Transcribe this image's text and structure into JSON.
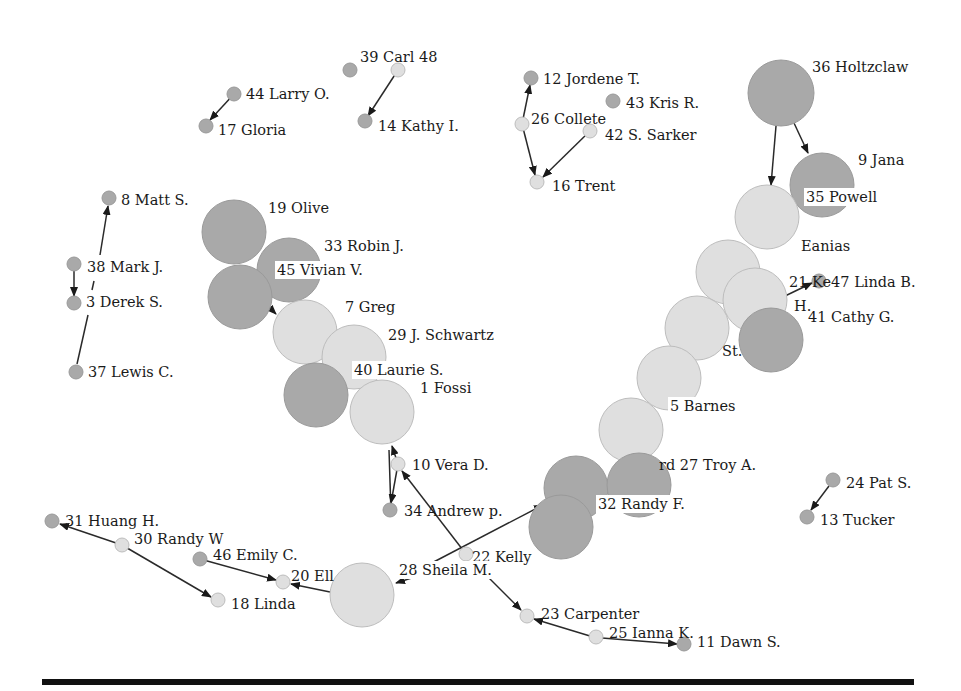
{
  "figure": {
    "width": 961,
    "height": 691,
    "colors": {
      "dark_node": "#a9a9a9",
      "light_node": "#dfdfdf",
      "edge": "#2a2a2a",
      "rule": "#111111"
    }
  },
  "nodes": [
    {
      "id": "39",
      "label": "39 Carl 48",
      "x": 350,
      "y": 70,
      "r": 7,
      "tone": "dark",
      "lx": 360,
      "ly": 58,
      "lbg": false
    },
    {
      "id": "48",
      "label": "",
      "x": 398,
      "y": 70,
      "r": 7,
      "tone": "light"
    },
    {
      "id": "44",
      "label": "44 Larry O.",
      "x": 234,
      "y": 94,
      "r": 7,
      "tone": "dark",
      "lx": 246,
      "ly": 95
    },
    {
      "id": "17",
      "label": "17 Gloria",
      "x": 206,
      "y": 126,
      "r": 7,
      "tone": "dark",
      "lx": 218,
      "ly": 131
    },
    {
      "id": "14",
      "label": "14 Kathy I.",
      "x": 365,
      "y": 121,
      "r": 7,
      "tone": "dark",
      "lx": 378,
      "ly": 127
    },
    {
      "id": "12",
      "label": "12 Jordene T.",
      "x": 531,
      "y": 78,
      "r": 7,
      "tone": "dark",
      "lx": 543,
      "ly": 80
    },
    {
      "id": "43",
      "label": "43 Kris R.",
      "x": 613,
      "y": 101,
      "r": 7,
      "tone": "dark",
      "lx": 626,
      "ly": 104
    },
    {
      "id": "26",
      "label": "26 Collete",
      "x": 522,
      "y": 124,
      "r": 7,
      "tone": "light",
      "lx": 531,
      "ly": 120
    },
    {
      "id": "42",
      "label": "42 S. Sarker",
      "x": 590,
      "y": 131,
      "r": 7,
      "tone": "light",
      "lx": 605,
      "ly": 136
    },
    {
      "id": "16",
      "label": "16 Trent",
      "x": 537,
      "y": 182,
      "r": 7,
      "tone": "light",
      "lx": 552,
      "ly": 187
    },
    {
      "id": "36",
      "label": "36 Holtzclaw",
      "x": 781,
      "y": 93,
      "r": 33,
      "tone": "dark",
      "lx": 812,
      "ly": 68
    },
    {
      "id": "9",
      "label": "9 Jana",
      "x": 822,
      "y": 185,
      "r": 32,
      "tone": "dark",
      "lx": 858,
      "ly": 161
    },
    {
      "id": "35",
      "label": "35 Powell",
      "x": 0,
      "y": 0,
      "r": 0,
      "tone": "none",
      "lx": 806,
      "ly": 198,
      "lbg": true
    },
    {
      "id": "eanias",
      "label": "Eanias",
      "x": 767,
      "y": 217,
      "r": 32,
      "tone": "light",
      "lx": 801,
      "ly": 247
    },
    {
      "id": "c_a",
      "label": "",
      "x": 728,
      "y": 272,
      "r": 32,
      "tone": "light"
    },
    {
      "id": "21",
      "label": "21 Ke47 Linda B.",
      "x": 819,
      "y": 281,
      "r": 7,
      "tone": "dark",
      "lx": 789,
      "ly": 283
    },
    {
      "id": "c_b",
      "label": "",
      "x": 755,
      "y": 300,
      "r": 32,
      "tone": "light"
    },
    {
      "id": "h",
      "label": "H.",
      "x": 0,
      "y": 0,
      "r": 0,
      "tone": "none",
      "lx": 794,
      "ly": 307
    },
    {
      "id": "41",
      "label": "41 Cathy G.",
      "x": 771,
      "y": 340,
      "r": 32,
      "tone": "dark",
      "lx": 808,
      "ly": 318
    },
    {
      "id": "c_c",
      "label": "",
      "x": 697,
      "y": 328,
      "r": 32,
      "tone": "light"
    },
    {
      "id": "st",
      "label": "St.",
      "x": 0,
      "y": 0,
      "r": 0,
      "tone": "none",
      "lx": 722,
      "ly": 352
    },
    {
      "id": "c_d",
      "label": "",
      "x": 669,
      "y": 378,
      "r": 32,
      "tone": "light"
    },
    {
      "id": "5",
      "label": "5 Barnes",
      "x": 0,
      "y": 0,
      "r": 0,
      "tone": "none",
      "lx": 670,
      "ly": 407,
      "lbg": true
    },
    {
      "id": "c_e",
      "label": "",
      "x": 631,
      "y": 430,
      "r": 32,
      "tone": "light"
    },
    {
      "id": "27",
      "label": "rd 27 Troy A.",
      "x": 0,
      "y": 0,
      "r": 0,
      "tone": "none",
      "lx": 659,
      "ly": 466
    },
    {
      "id": "c_f",
      "label": "",
      "x": 576,
      "y": 488,
      "r": 32,
      "tone": "dark"
    },
    {
      "id": "c_g",
      "label": "",
      "x": 639,
      "y": 485,
      "r": 32,
      "tone": "dark"
    },
    {
      "id": "32",
      "label": "32 Randy F.",
      "x": 0,
      "y": 0,
      "r": 0,
      "tone": "none",
      "lx": 598,
      "ly": 505,
      "lbg": true
    },
    {
      "id": "c_h",
      "label": "",
      "x": 561,
      "y": 527,
      "r": 32,
      "tone": "dark"
    },
    {
      "id": "22",
      "label": "22 Kelly",
      "x": 466,
      "y": 554,
      "r": 7,
      "tone": "light",
      "lx": 472,
      "ly": 558
    },
    {
      "id": "19",
      "label": "19 Olive",
      "x": 234,
      "y": 232,
      "r": 32,
      "tone": "dark",
      "lx": 268,
      "ly": 209
    },
    {
      "id": "33",
      "label": "33 Robin J.",
      "x": 289,
      "y": 270,
      "r": 32,
      "tone": "dark",
      "lx": 324,
      "ly": 247
    },
    {
      "id": "45",
      "label": "45 Vivian V.",
      "x": 240,
      "y": 297,
      "r": 32,
      "tone": "dark",
      "lx": 277,
      "ly": 271,
      "lbg": true
    },
    {
      "id": "7",
      "label": "7 Greg",
      "x": 305,
      "y": 332,
      "r": 32,
      "tone": "light",
      "lx": 345,
      "ly": 308
    },
    {
      "id": "29",
      "label": "29 J. Schwartz",
      "x": 354,
      "y": 357,
      "r": 32,
      "tone": "light",
      "lx": 388,
      "ly": 336
    },
    {
      "id": "40x",
      "label": "",
      "x": 316,
      "y": 395,
      "r": 32,
      "tone": "dark"
    },
    {
      "id": "40",
      "label": "40 Laurie S.",
      "x": 0,
      "y": 0,
      "r": 0,
      "tone": "none",
      "lx": 354,
      "ly": 371,
      "lbg": true
    },
    {
      "id": "1",
      "label": "1 Fossi",
      "x": 382,
      "y": 412,
      "r": 32,
      "tone": "light",
      "lx": 420,
      "ly": 389
    },
    {
      "id": "10",
      "label": "10 Vera D.",
      "x": 398,
      "y": 464,
      "r": 7,
      "tone": "light",
      "lx": 412,
      "ly": 466
    },
    {
      "id": "34",
      "label": "34 Andrew p.",
      "x": 390,
      "y": 510,
      "r": 7,
      "tone": "dark",
      "lx": 404,
      "ly": 512
    },
    {
      "id": "8",
      "label": "8 Matt S.",
      "x": 109,
      "y": 198,
      "r": 7,
      "tone": "dark",
      "lx": 121,
      "ly": 201
    },
    {
      "id": "38",
      "label": "38 Mark J.",
      "x": 74,
      "y": 264,
      "r": 7,
      "tone": "dark",
      "lx": 87,
      "ly": 268
    },
    {
      "id": "3",
      "label": "3 Derek S.",
      "x": 74,
      "y": 303,
      "r": 7,
      "tone": "dark",
      "lx": 86,
      "ly": 303
    },
    {
      "id": "37",
      "label": "37 Lewis C.",
      "x": 76,
      "y": 372,
      "r": 7,
      "tone": "dark",
      "lx": 88,
      "ly": 373
    },
    {
      "id": "24",
      "label": "24 Pat S.",
      "x": 833,
      "y": 480,
      "r": 7,
      "tone": "dark",
      "lx": 846,
      "ly": 484
    },
    {
      "id": "13",
      "label": "13 Tucker",
      "x": 807,
      "y": 517,
      "r": 7,
      "tone": "dark",
      "lx": 820,
      "ly": 521
    },
    {
      "id": "31",
      "label": "31 Huang H.",
      "x": 52,
      "y": 521,
      "r": 7,
      "tone": "dark",
      "lx": 65,
      "ly": 522
    },
    {
      "id": "30",
      "label": "30 Randy W",
      "x": 122,
      "y": 545,
      "r": 7,
      "tone": "light",
      "lx": 134,
      "ly": 540
    },
    {
      "id": "46",
      "label": "46 Emily C.",
      "x": 200,
      "y": 559,
      "r": 7,
      "tone": "dark",
      "lx": 213,
      "ly": 556
    },
    {
      "id": "20",
      "label": "20 Ell",
      "x": 283,
      "y": 582,
      "r": 7,
      "tone": "light",
      "lx": 291,
      "ly": 577
    },
    {
      "id": "18",
      "label": "18 Linda",
      "x": 218,
      "y": 600,
      "r": 7,
      "tone": "light",
      "lx": 231,
      "ly": 605
    },
    {
      "id": "28x",
      "label": "",
      "x": 362,
      "y": 595,
      "r": 32,
      "tone": "light"
    },
    {
      "id": "28",
      "label": "28 Sheila M.",
      "x": 0,
      "y": 0,
      "r": 0,
      "tone": "none",
      "lx": 399,
      "ly": 571,
      "lbg": true
    },
    {
      "id": "23",
      "label": "23 Carpenter",
      "x": 527,
      "y": 616,
      "r": 7,
      "tone": "light",
      "lx": 541,
      "ly": 615
    },
    {
      "id": "25",
      "label": "25 Ianna K.",
      "x": 596,
      "y": 637,
      "r": 7,
      "tone": "light",
      "lx": 609,
      "ly": 634
    },
    {
      "id": "11",
      "label": "11 Dawn S.",
      "x": 684,
      "y": 644,
      "r": 7,
      "tone": "dark",
      "lx": 697,
      "ly": 643
    }
  ],
  "edges": [
    {
      "from": [
        398,
        70
      ],
      "to": [
        368,
        116
      ]
    },
    {
      "from": [
        234,
        94
      ],
      "to": [
        210,
        120
      ]
    },
    {
      "from": [
        522,
        124
      ],
      "to": [
        530,
        85
      ]
    },
    {
      "from": [
        522,
        124
      ],
      "to": [
        535,
        175
      ]
    },
    {
      "from": [
        590,
        131
      ],
      "to": [
        543,
        177
      ]
    },
    {
      "from": [
        776,
        126
      ],
      "to": [
        771,
        185
      ]
    },
    {
      "from": [
        794,
        123
      ],
      "to": [
        808,
        153
      ]
    },
    {
      "from": [
        785,
        296
      ],
      "to": [
        812,
        283
      ]
    },
    {
      "from": [
        100,
        255
      ],
      "to": [
        108,
        206
      ]
    },
    {
      "from": [
        74,
        271
      ],
      "to": [
        74,
        296
      ]
    },
    {
      "from": [
        94,
        281
      ],
      "to": [
        92,
        290
      ],
      "arrow": false
    },
    {
      "from": [
        88,
        315
      ],
      "to": [
        77,
        364
      ],
      "arrow": false
    },
    {
      "from": [
        829,
        486
      ],
      "to": [
        811,
        510
      ]
    },
    {
      "from": [
        122,
        545
      ],
      "to": [
        60,
        524
      ]
    },
    {
      "from": [
        122,
        545
      ],
      "to": [
        211,
        597
      ]
    },
    {
      "from": [
        200,
        559
      ],
      "to": [
        276,
        580
      ]
    },
    {
      "from": [
        330,
        592
      ],
      "to": [
        291,
        584
      ]
    },
    {
      "from": [
        391,
        512
      ],
      "to": [
        389,
        450
      ],
      "arrow": false
    },
    {
      "from": [
        398,
        464
      ],
      "to": [
        391,
        503
      ]
    },
    {
      "from": [
        398,
        464
      ],
      "to": [
        392,
        446
      ]
    },
    {
      "from": [
        466,
        554
      ],
      "to": [
        402,
        471
      ]
    },
    {
      "from": [
        426,
        566
      ],
      "to": [
        543,
        505
      ]
    },
    {
      "from": [
        424,
        574
      ],
      "to": [
        396,
        583
      ]
    },
    {
      "from": [
        483,
        572
      ],
      "to": [
        521,
        610
      ]
    },
    {
      "from": [
        590,
        636
      ],
      "to": [
        534,
        619
      ]
    },
    {
      "from": [
        602,
        638
      ],
      "to": [
        677,
        644
      ]
    },
    {
      "from": [
        268,
        306
      ],
      "to": [
        276,
        314
      ]
    }
  ]
}
